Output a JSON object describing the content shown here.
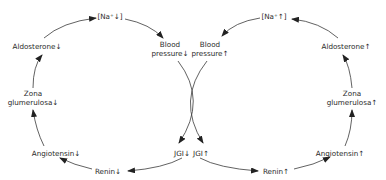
{
  "diagram": {
    "type": "dual feedback cycle",
    "colors": {
      "line": "#3a3a3a",
      "text": "#2a2a2a",
      "background": "#ffffff"
    },
    "left_cycle": {
      "direction": "decrease",
      "arrow_symbol": "↓",
      "nodes": {
        "sodium": "[Na⁺↓]",
        "bp_line1": "Blood",
        "bp_line2": "pressure↓",
        "jgi": "JGI↓",
        "renin": "Renin↓",
        "angiotensin": "Angiotensin↓",
        "zona_line1": "Zona",
        "zona_line2": "glumerulosa↓",
        "aldosterone": "Aldosterone↓"
      },
      "sequence": [
        "[Na⁺↓]",
        "Blood pressure↓",
        "JGI↓",
        "Renin↓",
        "Angiotensin↓",
        "Zona glumerulosa↓",
        "Aldosterone↓",
        "[Na⁺↓]"
      ]
    },
    "right_cycle": {
      "direction": "increase",
      "arrow_symbol": "↑",
      "nodes": {
        "sodium": "[Na⁺↑]",
        "bp_line1": "Blood",
        "bp_line2": "pressure↑",
        "jgi": "JGI↑",
        "renin": "Renin↑",
        "angiotensin": "Angiotensin↑",
        "zona_line1": "Zona",
        "zona_line2": "glumerulosa↑",
        "aldosterone": "Aldosterone↑"
      },
      "sequence": [
        "[Na⁺↑]",
        "Blood pressure↑",
        "JGI↑",
        "Renin↑",
        "Angiotensin↑",
        "Zona glumerulosa↑",
        "Aldosterone↑",
        "[Na⁺↑]"
      ]
    }
  }
}
